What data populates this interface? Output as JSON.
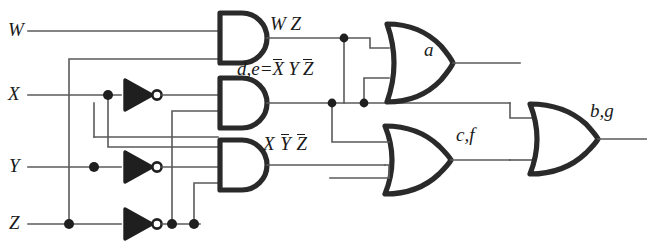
{
  "diagram": {
    "type": "logic-circuit-schematic",
    "wire_color": "#5a5a5a",
    "gate_color": "#2a2a2a",
    "background": "#ffffff"
  },
  "inputs": [
    {
      "id": "w",
      "label": "W",
      "y": 31
    },
    {
      "id": "x",
      "label": "X",
      "y": 95
    },
    {
      "id": "y",
      "label": "Y",
      "y": 167
    },
    {
      "id": "z",
      "label": "Z",
      "y": 224
    }
  ],
  "inverters": [
    {
      "id": "inv-x",
      "input": "X",
      "output": "X-bar"
    },
    {
      "id": "inv-y",
      "input": "Y",
      "output": "Y-bar"
    },
    {
      "id": "inv-z",
      "input": "Z",
      "output": "Z-bar"
    }
  ],
  "and_gates": [
    {
      "id": "and-wz",
      "inputs": 2,
      "term": "W Z"
    },
    {
      "id": "and-de",
      "inputs": 3,
      "term": "d,e = X̅YZ̅"
    },
    {
      "id": "and-xyz",
      "inputs": 3,
      "term": "X Y̅ Z̅"
    }
  ],
  "or_gates": [
    {
      "id": "or-a",
      "inputs": 2,
      "output": "a"
    },
    {
      "id": "or-cf",
      "inputs": 2,
      "output": "c,f"
    },
    {
      "id": "or-bg",
      "inputs": 2,
      "output": "b,g"
    }
  ],
  "terms": {
    "wz": {
      "text": "W Z",
      "x": 268,
      "y": 14
    },
    "de_prefix": "d,e=",
    "de": {
      "x": 236,
      "y": 58
    },
    "xyz": {
      "x": 262,
      "y": 135
    }
  },
  "outputs": {
    "a": {
      "label": "a",
      "x": 424,
      "y": 38
    },
    "cf": {
      "label": "c,f",
      "x": 455,
      "y": 122
    },
    "bg": {
      "label": "b,g",
      "x": 589,
      "y": 100
    }
  }
}
